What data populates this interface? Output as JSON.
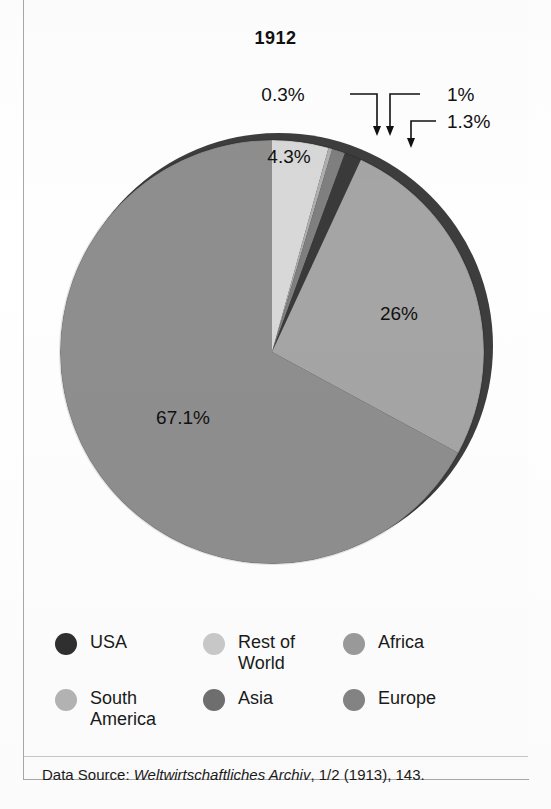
{
  "figure": {
    "title": "1912",
    "source_prefix": "Data Source: ",
    "source_italic": "Weltwirtschaftliches Archiv",
    "source_suffix": ", 1/2 (1913), 143."
  },
  "chart_data": {
    "type": "pie",
    "title": "1912",
    "xlabel": "",
    "ylabel": "",
    "legend_position": "bottom",
    "grid": false,
    "unit": "percent",
    "categories": [
      "Rest of World",
      "South America",
      "Asia",
      "USA",
      "Africa",
      "Europe"
    ],
    "values": [
      4.3,
      0.3,
      1,
      1.3,
      26,
      67.1
    ],
    "labels": [
      "4.3%",
      "0.3%",
      "1%",
      "1.3%",
      "26%",
      "67.1%"
    ],
    "colors": [
      "#d8d8d8",
      "#aeaeae",
      "#7f7f7f",
      "#3a3a3a",
      "#a5a5a5",
      "#8e8e8e"
    ],
    "slices": [
      {
        "name": "Rest of World",
        "value": 4.3,
        "label": "4.3%",
        "color": "#d8d8d8",
        "label_placement": "inside"
      },
      {
        "name": "South America",
        "value": 0.3,
        "label": "0.3%",
        "color": "#aeaeae",
        "label_placement": "callout"
      },
      {
        "name": "Asia",
        "value": 1,
        "label": "1%",
        "color": "#7f7f7f",
        "label_placement": "callout"
      },
      {
        "name": "USA",
        "value": 1.3,
        "label": "1.3%",
        "color": "#3a3a3a",
        "label_placement": "callout"
      },
      {
        "name": "Africa",
        "value": 26,
        "label": "26%",
        "color": "#a5a5a5",
        "label_placement": "inside"
      },
      {
        "name": "Europe",
        "value": 67.1,
        "label": "67.1%",
        "color": "#8e8e8e",
        "label_placement": "inside"
      }
    ]
  },
  "legend": {
    "items": [
      {
        "label": "USA",
        "color": "#2f2f2f"
      },
      {
        "label": "Rest of\nWorld",
        "color": "#c9c9c9"
      },
      {
        "label": "Africa",
        "color": "#9b9b9b"
      },
      {
        "label": "South\nAmerica",
        "color": "#b4b4b4"
      },
      {
        "label": "Asia",
        "color": "#6f6f6f"
      },
      {
        "label": "Europe",
        "color": "#848484"
      }
    ]
  },
  "callouts": [
    {
      "label": "0.3%",
      "target": "South America"
    },
    {
      "label": "1%",
      "target": "Asia"
    },
    {
      "label": "1.3%",
      "target": "USA"
    }
  ]
}
